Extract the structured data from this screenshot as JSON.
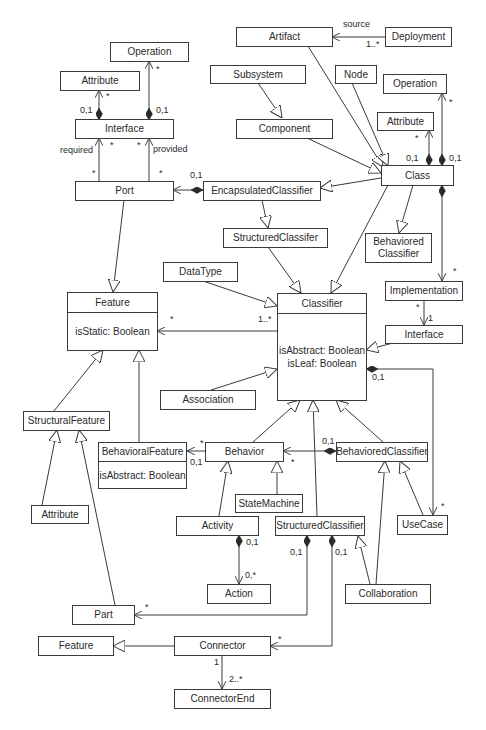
{
  "diagram": {
    "type": "UML class diagram (metamodel)",
    "stroke_color": "#3a3a3a",
    "text_color": "#2a2a2a",
    "classes": {
      "operation_top": {
        "name": "Operation"
      },
      "attribute_top": {
        "name": "Attribute"
      },
      "interface_top": {
        "name": "Interface"
      },
      "port": {
        "name": "Port"
      },
      "artifact": {
        "name": "Artifact"
      },
      "deployment": {
        "name": "Deployment"
      },
      "subsystem": {
        "name": "Subsystem"
      },
      "node": {
        "name": "Node"
      },
      "operation_right": {
        "name": "Operation"
      },
      "attribute_right": {
        "name": "Attribute"
      },
      "component": {
        "name": "Component"
      },
      "class": {
        "name": "Class"
      },
      "encapsulated_classifier": {
        "name": "EncapsulatedClassifier"
      },
      "structured_classifer_top": {
        "name": "StructuredClassifer"
      },
      "behaviored_classifier_top": {
        "name_line1": "Behaviored",
        "name_line2": "Classifier"
      },
      "datatype": {
        "name": "DataType"
      },
      "implementation": {
        "name": "Implementation"
      },
      "interface_right": {
        "name": "Interface"
      },
      "feature": {
        "name": "Feature",
        "attr1": "isStatic: Boolean"
      },
      "classifier": {
        "name": "Classifier",
        "attr1": "isAbstract: Boolean",
        "attr2": "isLeaf: Boolean"
      },
      "association": {
        "name": "Association"
      },
      "structural_feature": {
        "name": "StructuralFeature"
      },
      "behavioral_feature": {
        "name": "BehavioralFeature",
        "attr1": "isAbstract: Boolean"
      },
      "behavior": {
        "name": "Behavior"
      },
      "behaviored_classifier": {
        "name": "BehavioredClassifier"
      },
      "attribute_bottom": {
        "name": "Attribute"
      },
      "state_machine": {
        "name": "StateMachine"
      },
      "activity": {
        "name": "Activity"
      },
      "structured_classifier": {
        "name": "StructuredClassifier"
      },
      "use_case": {
        "name": "UseCase"
      },
      "action": {
        "name": "Action"
      },
      "collaboration": {
        "name": "Collaboration"
      },
      "part": {
        "name": "Part"
      },
      "feature_bottom": {
        "name": "Feature"
      },
      "connector": {
        "name": "Connector"
      },
      "connector_end": {
        "name": "ConnectorEnd"
      }
    },
    "labels": {
      "op_top_star": "*",
      "attr_top_star": "*",
      "attr_top_01": "0,1",
      "op_top_01": "0,1",
      "required": "required",
      "provided": "provided",
      "req_star_top": "*",
      "prov_star_top": "*",
      "req_star_bottom": "*",
      "prov_star_bottom": "*",
      "port_01": "0,1",
      "source": "source",
      "deploy_mult": "1..*",
      "op_right_star": "*",
      "attr_right_star": "*",
      "attr_right_01": "0,1",
      "op_right_01": "0,1",
      "impl_star": "*",
      "impl_star2": "*",
      "iface_1": "1",
      "feature_star": "*",
      "classifier_mult": "1..*",
      "classifier_01": "0,1",
      "bf_star": "*",
      "bf_01": "0,1",
      "bc_01": "0,1",
      "behavior_star": "*",
      "usecase_star": "*",
      "activity_01": "0,1",
      "action_mult": "0,*",
      "sc_01_left": "0,1",
      "sc_01_right": "0,1",
      "part_star": "*",
      "connector_star": "*",
      "conn_1": "1",
      "conn_end_mult": "2..*"
    }
  }
}
